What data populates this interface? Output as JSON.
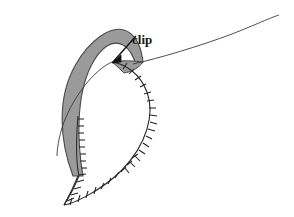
{
  "figure": {
    "kind": "sewing-illustration",
    "background_color": "#ffffff",
    "ink_color": "#222222",
    "shaded_color": "#9a9a9a",
    "shaded_stroke_color": "#4a4a4a"
  },
  "annotations": {
    "clip_label": "clip"
  },
  "shapes": {
    "seam_allowance_band": {
      "name": "shaded-seam-allowance",
      "fill": "#9a9a9a",
      "stroke": "#4a4a4a",
      "outer_path": "M 72 175 C 60 140 58 96 78 64 C 96 36 122 21 138 48 C 143 58 140 62 140 62",
      "inner_path": "M 140 62 C 130 58 124 53 116 50 C 98 41 88 52 82 68 C 72 96 74 140 82 175"
    },
    "main_piece": {
      "name": "pattern-piece-outline",
      "stroke": "#222222",
      "path": "M 79 173 C 68 200 64 204 64 204 C 64 204 96 194 118 172 C 145 145 152 112 150 92 C 148 72 140 64 133 62"
    },
    "inner_fold_line": {
      "name": "inner-fold-curve",
      "stroke": "#3a3a3a",
      "path": "M 114 62 C 92 74 70 104 62 132 C 58 146 58 155 58 155"
    },
    "thread_tail": {
      "name": "thread-tail-curve",
      "stroke": "#3a3a3a",
      "path": "M 134 63 C 168 54 216 42 248 30 C 266 23 276 18 278 17"
    },
    "clip_arrow": {
      "name": "clip-leader-arrow",
      "stroke": "#111111",
      "path": "M 134 35 L 113 62",
      "head": "M 113 62 L 120 54 L 122 60 Z"
    }
  },
  "tick_marks": {
    "name": "clipped-notch-ticks",
    "color": "#222222",
    "left_edge_count": 13,
    "right_edge_count": 16,
    "bottom_count": 10
  },
  "label_positions": {
    "clip_x": 132,
    "clip_y": 44
  }
}
